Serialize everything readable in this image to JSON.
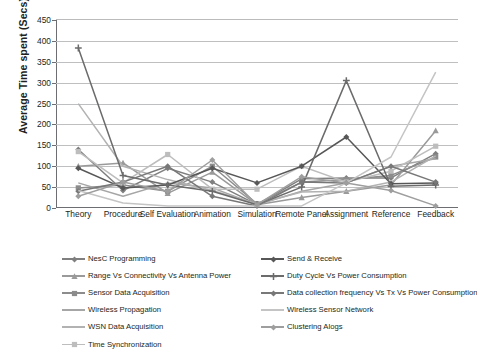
{
  "chart_data": {
    "type": "line",
    "title": "",
    "xlabel": "",
    "ylabel": "Average Time spent (Secs)",
    "ylim": [
      0,
      450
    ],
    "yticks": [
      0,
      50,
      100,
      150,
      200,
      250,
      300,
      350,
      400,
      450
    ],
    "grid": true,
    "legend_position": "bottom",
    "categories": [
      "Theory",
      "Procedure",
      "Self Evaluation",
      "Animation",
      "Simulation",
      "Remote Panel",
      "Assignment",
      "Reference",
      "Feedback"
    ],
    "series": [
      {
        "name": "NesC Programming",
        "marker": "diamond",
        "color": "#7f7f7f",
        "values": [
          140,
          42,
          95,
          62,
          8,
          70,
          72,
          72,
          130
        ]
      },
      {
        "name": "Range  Vs Connectivity Vs Antenna Power",
        "marker": "triangle",
        "color": "#9a9a9a",
        "values": [
          100,
          108,
          35,
          86,
          8,
          25,
          40,
          55,
          185
        ]
      },
      {
        "name": "Sensor Data Acquisition",
        "marker": "square",
        "color": "#8c8c8c",
        "values": [
          48,
          55,
          40,
          100,
          10,
          62,
          68,
          78,
          122
        ]
      },
      {
        "name": "Wireless Propagation",
        "marker": "none",
        "color": "#a6a6a6",
        "values": [
          60,
          28,
          60,
          48,
          8,
          40,
          60,
          100,
          118
        ]
      },
      {
        "name": "WSN Data Acquisition",
        "marker": "none",
        "color": "#b2b2b2",
        "values": [
          250,
          100,
          68,
          42,
          10,
          38,
          40,
          62,
          125
        ]
      },
      {
        "name": "Time Synchronization",
        "marker": "square",
        "color": "#bdbdbd",
        "values": [
          135,
          60,
          128,
          45,
          45,
          100,
          62,
          88,
          148
        ]
      },
      {
        "name": "Send & Receive",
        "marker": "diamond",
        "color": "#575757",
        "values": [
          95,
          48,
          55,
          95,
          60,
          100,
          170,
          58,
          60
        ]
      },
      {
        "name": "Duty Cycle Vs Power Consumption",
        "marker": "plus",
        "color": "#6b6b6b",
        "values": [
          383,
          78,
          55,
          40,
          8,
          50,
          305,
          52,
          55
        ]
      },
      {
        "name": "Data collection frequency Vs Tx Vs Power Consumption",
        "marker": "diamond",
        "color": "#787878",
        "values": [
          40,
          62,
          100,
          28,
          5,
          62,
          60,
          100,
          62
        ]
      },
      {
        "name": "Wireless Sensor Network",
        "marker": "none",
        "color": "#c4c4c4",
        "values": [
          42,
          12,
          5,
          5,
          5,
          5,
          60,
          122,
          325
        ]
      },
      {
        "name": "Clustering Alogs",
        "marker": "diamond",
        "color": "#9e9e9e",
        "values": [
          28,
          62,
          40,
          115,
          8,
          75,
          60,
          42,
          5
        ]
      }
    ]
  }
}
